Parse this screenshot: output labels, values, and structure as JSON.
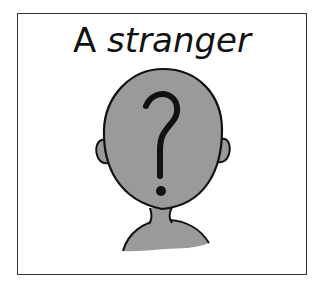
{
  "card": {
    "title_article": "A",
    "title_word": "stranger",
    "illustration": "unknown-person-silhouette-with-question-mark",
    "colors": {
      "head": "#9a9a9a",
      "outline": "#111111",
      "border": "#333333"
    }
  }
}
